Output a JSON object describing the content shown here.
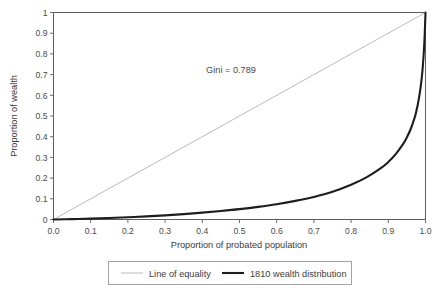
{
  "chart_data": {
    "type": "line",
    "title": "",
    "xlabel": "Proportion of probated population",
    "ylabel": "Proportion of wealth",
    "xlim": [
      0,
      1
    ],
    "ylim": [
      0,
      1
    ],
    "grid": false,
    "legend_position": "bottom",
    "annotations": [
      {
        "text": "Gini = 0.789",
        "x": 0.45,
        "y": 0.72
      }
    ],
    "xticklabels": [
      "0.0",
      "0.1",
      "0.2",
      "0.3",
      "0.4",
      "0.5",
      "0.6",
      "0.7",
      "0.8",
      "0.9",
      "1.0"
    ],
    "xtickvalues": [
      0,
      0.1,
      0.2,
      0.3,
      0.4,
      0.5,
      0.6,
      0.7,
      0.8,
      0.9,
      1.0
    ],
    "yticklabels": [
      "0",
      "0.1",
      "0.2",
      "0.3",
      "0.4",
      "0.5",
      "0.6",
      "0.7",
      "0.8",
      "0.9",
      "1"
    ],
    "ytickvalues": [
      0,
      0.1,
      0.2,
      0.3,
      0.4,
      0.5,
      0.6,
      0.7,
      0.8,
      0.9,
      1.0
    ],
    "series": [
      {
        "name": "Line of equality",
        "color": "#a8a8a8",
        "width": 0.8,
        "x": [
          0,
          1
        ],
        "values": [
          0,
          1
        ]
      },
      {
        "name": "1810 wealth distribution",
        "color": "#1d1d1d",
        "width": 2.1,
        "x": [
          0.0,
          0.05,
          0.1,
          0.15,
          0.2,
          0.25,
          0.3,
          0.35,
          0.4,
          0.45,
          0.5,
          0.55,
          0.6,
          0.65,
          0.7,
          0.75,
          0.8,
          0.84,
          0.88,
          0.9,
          0.92,
          0.94,
          0.95,
          0.96,
          0.97,
          0.975,
          0.98,
          0.985,
          0.99,
          0.993,
          0.996,
          0.998,
          1.0
        ],
        "values": [
          0.0,
          0.002,
          0.004,
          0.007,
          0.011,
          0.015,
          0.02,
          0.026,
          0.033,
          0.041,
          0.05,
          0.061,
          0.074,
          0.09,
          0.109,
          0.134,
          0.168,
          0.202,
          0.248,
          0.278,
          0.316,
          0.365,
          0.397,
          0.436,
          0.487,
          0.52,
          0.562,
          0.615,
          0.685,
          0.745,
          0.825,
          0.9,
          1.0
        ]
      }
    ]
  },
  "legend": {
    "items": [
      {
        "label": "Line of equality"
      },
      {
        "label": "1810 wealth distribution"
      }
    ]
  }
}
